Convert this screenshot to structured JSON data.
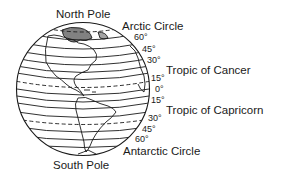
{
  "diagram": {
    "type": "globe-latitude",
    "labels": {
      "north_pole": "North Pole",
      "south_pole": "South Pole",
      "arctic_circle": "Arctic Circle",
      "antarctic_circle": "Antarctic Circle",
      "tropic_cancer": "Tropic of Cancer",
      "tropic_capricorn": "Tropic of Capricorn"
    },
    "degrees": {
      "n60": "60°",
      "n45": "45°",
      "n30": "30°",
      "n15": "15°",
      "eq": "0°",
      "s15": "15°",
      "s30": "30°",
      "s45": "45°",
      "s60": "60°"
    },
    "colors": {
      "line": "#1a1a1a",
      "background": "#ffffff"
    }
  }
}
